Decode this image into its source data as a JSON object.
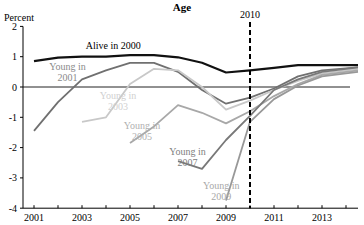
{
  "chart_data": {
    "type": "line",
    "title": "Age",
    "ylabel": "Percent",
    "xlabel": "",
    "ylim": [
      -4,
      2
    ],
    "xlim": [
      2000.5,
      2014.6
    ],
    "yticks": [
      2,
      1,
      0,
      -1,
      -2,
      -3,
      -4
    ],
    "xticks": [
      2001,
      2003,
      2005,
      2007,
      2009,
      2011,
      2013
    ],
    "grid": false,
    "legend": "inline labels",
    "reference_line": {
      "x": 2010,
      "label": "2010",
      "style": "dashed"
    },
    "zero_line": true,
    "series": [
      {
        "name": "Alive in 2000",
        "color": "#111111",
        "width": 2.2,
        "x": [
          2001,
          2002,
          2003,
          2004,
          2005,
          2006,
          2007,
          2008,
          2009,
          2010,
          2011,
          2012,
          2013,
          2014.5
        ],
        "values": [
          0.85,
          0.97,
          1.0,
          1.0,
          1.05,
          1.05,
          0.98,
          0.8,
          0.48,
          0.55,
          0.63,
          0.72,
          0.72,
          0.72
        ]
      },
      {
        "name": "Young in 2001",
        "color": "#707070",
        "width": 1.8,
        "x": [
          2001,
          2002,
          2003,
          2004,
          2005,
          2006,
          2007,
          2008,
          2009,
          2010,
          2011,
          2012,
          2013,
          2014.5
        ],
        "values": [
          -1.45,
          -0.5,
          0.25,
          0.55,
          0.8,
          0.8,
          0.5,
          -0.1,
          -0.55,
          -0.35,
          -0.05,
          0.35,
          0.55,
          0.65
        ]
      },
      {
        "name": "Young in 2003",
        "color": "#c8c8c8",
        "width": 1.8,
        "x": [
          2003,
          2004,
          2005,
          2006,
          2007,
          2008,
          2009,
          2010,
          2011,
          2012,
          2013,
          2014.5
        ],
        "values": [
          -1.15,
          -1.0,
          0.1,
          0.6,
          0.55,
          0.0,
          -0.75,
          -0.45,
          -0.1,
          0.2,
          0.45,
          0.6
        ]
      },
      {
        "name": "Young in 2005",
        "color": "#a8a8a8",
        "width": 1.8,
        "x": [
          2005,
          2006,
          2007,
          2008,
          2009,
          2010,
          2011,
          2012,
          2013,
          2014.5
        ],
        "values": [
          -1.85,
          -1.3,
          -0.6,
          -0.85,
          -1.2,
          -0.8,
          -0.3,
          0.1,
          0.4,
          0.55
        ]
      },
      {
        "name": "Young in 2007",
        "color": "#787878",
        "width": 1.8,
        "x": [
          2007,
          2008,
          2009,
          2010,
          2011,
          2012,
          2013,
          2014.5
        ],
        "values": [
          -2.45,
          -2.7,
          -1.75,
          -0.95,
          -0.1,
          0.25,
          0.5,
          0.65
        ]
      },
      {
        "name": "Young in 2009",
        "color": "#989898",
        "width": 1.8,
        "x": [
          2009,
          2010,
          2011,
          2012,
          2013,
          2014.5
        ],
        "values": [
          -3.75,
          -1.15,
          -0.4,
          0.05,
          0.35,
          0.5
        ]
      }
    ],
    "annotations": [
      {
        "text": [
          "Alive in 2000"
        ],
        "x": 2004.3,
        "y": 1.25,
        "color": "#000000"
      },
      {
        "text": [
          "Young in",
          "2001"
        ],
        "x": 2002.4,
        "y": 0.55,
        "color": "#8a8a8a"
      },
      {
        "text": [
          "Young in",
          "2003"
        ],
        "x": 2004.5,
        "y": -0.4,
        "color": "#d0d0d0"
      },
      {
        "text": [
          "Young in",
          "2005"
        ],
        "x": 2005.5,
        "y": -1.4,
        "color": "#b0b0b0"
      },
      {
        "text": [
          "Young in",
          "2007"
        ],
        "x": 2007.4,
        "y": -2.25,
        "color": "#808080"
      },
      {
        "text": [
          "Young in",
          "2009"
        ],
        "x": 2008.8,
        "y": -3.35,
        "color": "#a8a8a8"
      }
    ]
  }
}
